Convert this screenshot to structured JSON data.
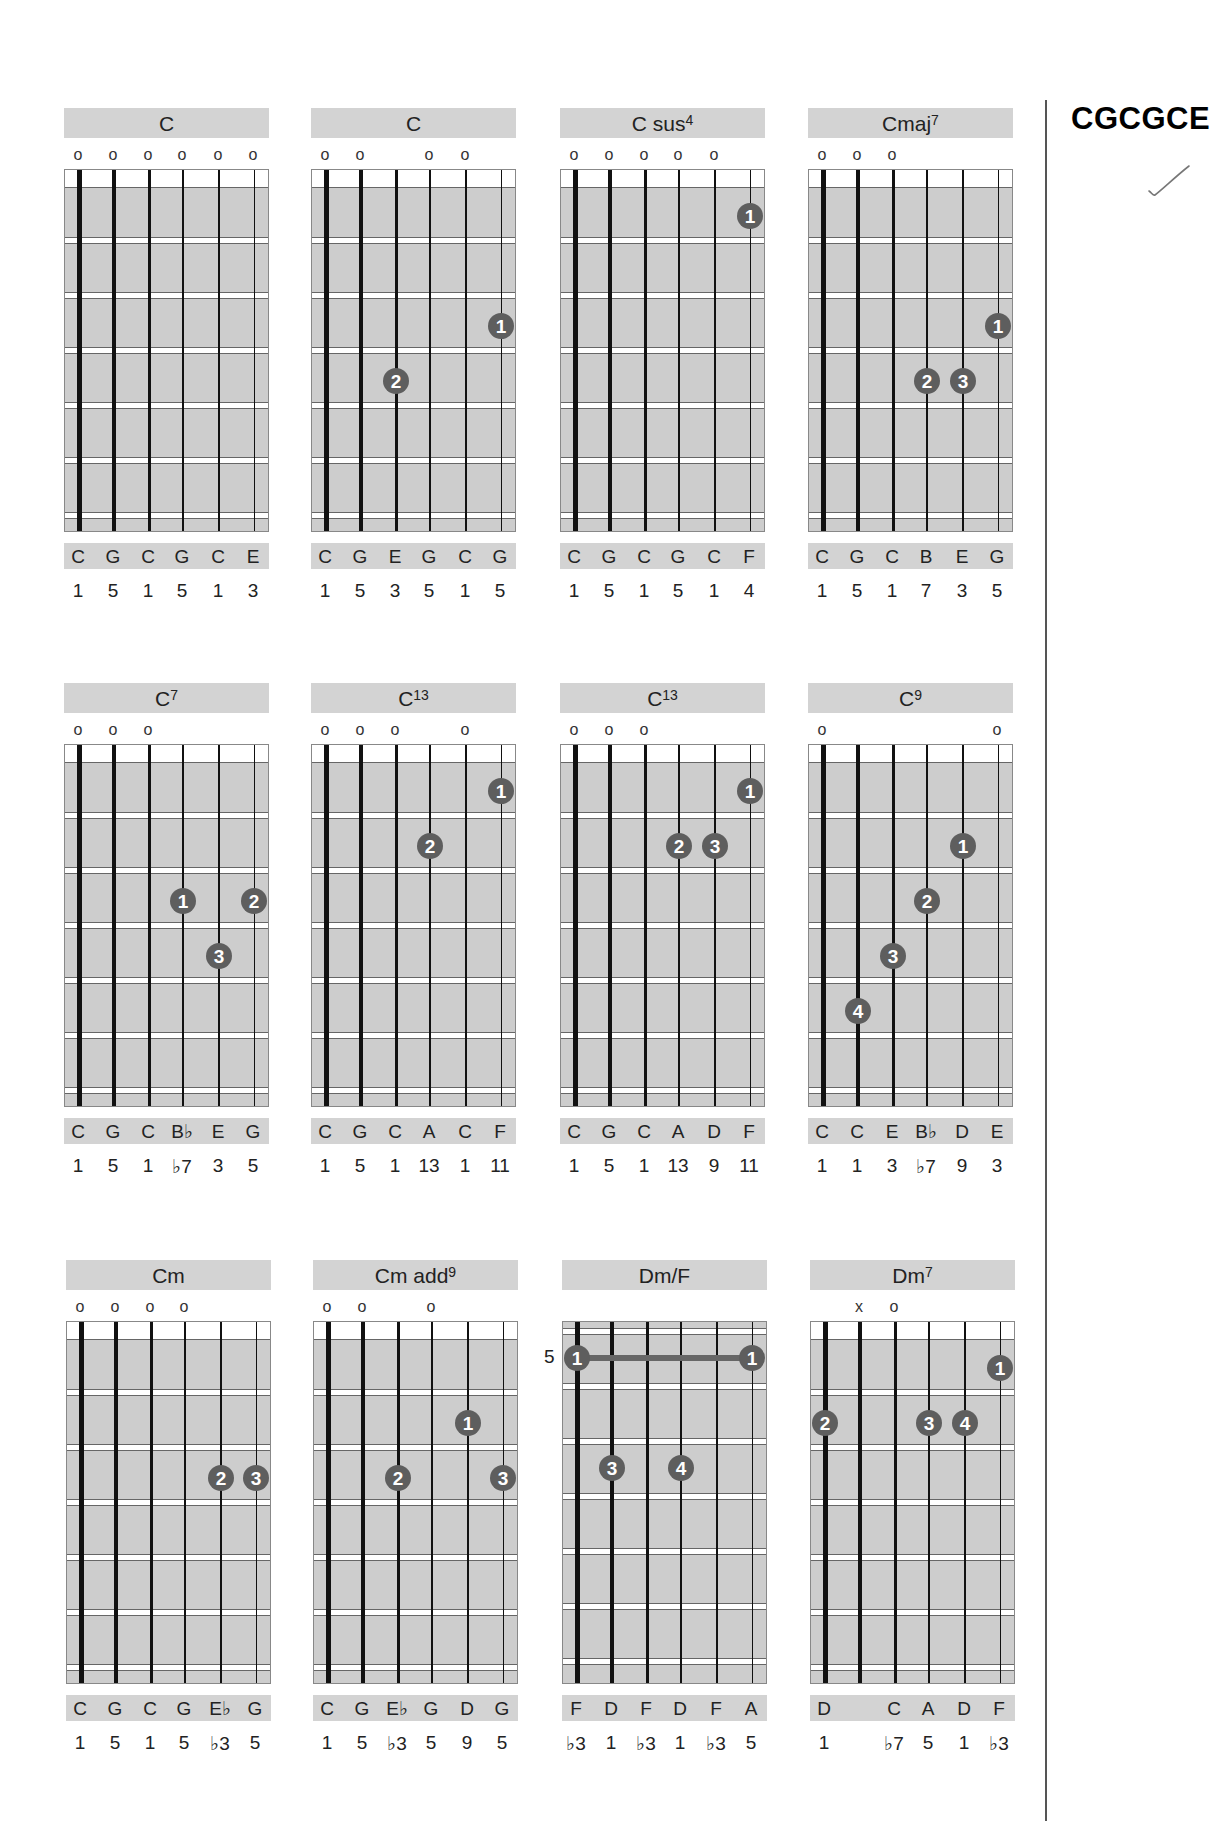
{
  "page": {
    "tuning_title": "CGCGCE",
    "check_mark": "checkmark"
  },
  "colors": {
    "header_bg": "#d3d3d3",
    "fretboard_bg": "#cdcdcd",
    "finger_dot": "#5e5e5e",
    "finger_text": "#ffffff",
    "string": "#111111"
  },
  "layout": {
    "columns_x": [
      64,
      311,
      560,
      808
    ],
    "rows": [
      {
        "top": 108,
        "x_offset": 0
      },
      {
        "top": 683,
        "x_offset": 0
      },
      {
        "top": 1260,
        "x_offset": 2
      }
    ]
  },
  "chords": [
    {
      "row": 0,
      "col": 0,
      "name": "C",
      "sup": "",
      "open": [
        "o",
        "o",
        "o",
        "o",
        "o",
        "o"
      ],
      "nut": true,
      "dots": [],
      "notes": [
        "C",
        "G",
        "C",
        "G",
        "C",
        "E"
      ],
      "intervals": [
        "1",
        "5",
        "1",
        "5",
        "1",
        "3"
      ]
    },
    {
      "row": 0,
      "col": 1,
      "name": "C",
      "sup": "",
      "open": [
        "o",
        "o",
        "",
        "o",
        "o",
        ""
      ],
      "nut": true,
      "dots": [
        {
          "string": 6,
          "fret": 3,
          "finger": "1"
        },
        {
          "string": 3,
          "fret": 4,
          "finger": "2"
        }
      ],
      "notes": [
        "C",
        "G",
        "E",
        "G",
        "C",
        "G"
      ],
      "intervals": [
        "1",
        "5",
        "3",
        "5",
        "1",
        "5"
      ]
    },
    {
      "row": 0,
      "col": 2,
      "name": "C sus",
      "sup": "4",
      "open": [
        "o",
        "o",
        "o",
        "o",
        "o",
        ""
      ],
      "nut": true,
      "dots": [
        {
          "string": 6,
          "fret": 1,
          "finger": "1"
        }
      ],
      "notes": [
        "C",
        "G",
        "C",
        "G",
        "C",
        "F"
      ],
      "intervals": [
        "1",
        "5",
        "1",
        "5",
        "1",
        "4"
      ]
    },
    {
      "row": 0,
      "col": 3,
      "name": "Cmaj",
      "sup": "7",
      "open": [
        "o",
        "o",
        "o",
        "",
        "",
        ""
      ],
      "nut": true,
      "dots": [
        {
          "string": 6,
          "fret": 3,
          "finger": "1"
        },
        {
          "string": 4,
          "fret": 4,
          "finger": "2"
        },
        {
          "string": 5,
          "fret": 4,
          "finger": "3"
        }
      ],
      "notes": [
        "C",
        "G",
        "C",
        "B",
        "E",
        "G"
      ],
      "intervals": [
        "1",
        "5",
        "1",
        "7",
        "3",
        "5"
      ]
    },
    {
      "row": 1,
      "col": 0,
      "name": "C",
      "sup": "7",
      "open": [
        "o",
        "o",
        "o",
        "",
        "",
        ""
      ],
      "nut": true,
      "dots": [
        {
          "string": 4,
          "fret": 3,
          "finger": "1"
        },
        {
          "string": 6,
          "fret": 3,
          "finger": "2"
        },
        {
          "string": 5,
          "fret": 4,
          "finger": "3"
        }
      ],
      "notes": [
        "C",
        "G",
        "C",
        "B♭",
        "E",
        "G"
      ],
      "intervals": [
        "1",
        "5",
        "1",
        "♭7",
        "3",
        "5"
      ]
    },
    {
      "row": 1,
      "col": 1,
      "name": "C",
      "sup": "13",
      "open": [
        "o",
        "o",
        "o",
        "",
        "o",
        ""
      ],
      "nut": true,
      "dots": [
        {
          "string": 6,
          "fret": 1,
          "finger": "1"
        },
        {
          "string": 4,
          "fret": 2,
          "finger": "2"
        }
      ],
      "notes": [
        "C",
        "G",
        "C",
        "A",
        "C",
        "F"
      ],
      "intervals": [
        "1",
        "5",
        "1",
        "13",
        "1",
        "11"
      ]
    },
    {
      "row": 1,
      "col": 2,
      "name": "C",
      "sup": "13",
      "open": [
        "o",
        "o",
        "o",
        "",
        "",
        ""
      ],
      "nut": true,
      "dots": [
        {
          "string": 6,
          "fret": 1,
          "finger": "1"
        },
        {
          "string": 4,
          "fret": 2,
          "finger": "2"
        },
        {
          "string": 5,
          "fret": 2,
          "finger": "3"
        }
      ],
      "notes": [
        "C",
        "G",
        "C",
        "A",
        "D",
        "F"
      ],
      "intervals": [
        "1",
        "5",
        "1",
        "13",
        "9",
        "11"
      ]
    },
    {
      "row": 1,
      "col": 3,
      "name": "C",
      "sup": "9",
      "open": [
        "o",
        "",
        "",
        "",
        "",
        "o"
      ],
      "nut": true,
      "dots": [
        {
          "string": 5,
          "fret": 2,
          "finger": "1"
        },
        {
          "string": 4,
          "fret": 3,
          "finger": "2"
        },
        {
          "string": 3,
          "fret": 4,
          "finger": "3"
        },
        {
          "string": 2,
          "fret": 5,
          "finger": "4"
        }
      ],
      "notes": [
        "C",
        "C",
        "E",
        "B♭",
        "D",
        "E"
      ],
      "intervals": [
        "1",
        "1",
        "3",
        "♭7",
        "9",
        "3"
      ]
    },
    {
      "row": 2,
      "col": 0,
      "name": "Cm",
      "sup": "",
      "open": [
        "o",
        "o",
        "o",
        "o",
        "",
        ""
      ],
      "nut": true,
      "dots": [
        {
          "string": 5,
          "fret": 3,
          "finger": "2"
        },
        {
          "string": 6,
          "fret": 3,
          "finger": "3"
        }
      ],
      "notes": [
        "C",
        "G",
        "C",
        "G",
        "E♭",
        "G"
      ],
      "intervals": [
        "1",
        "5",
        "1",
        "5",
        "♭3",
        "5"
      ]
    },
    {
      "row": 2,
      "col": 1,
      "name": "Cm add",
      "sup": "9",
      "open": [
        "o",
        "o",
        "",
        "o",
        "",
        ""
      ],
      "nut": true,
      "dots": [
        {
          "string": 5,
          "fret": 2,
          "finger": "1"
        },
        {
          "string": 3,
          "fret": 3,
          "finger": "2"
        },
        {
          "string": 6,
          "fret": 3,
          "finger": "3"
        }
      ],
      "notes": [
        "C",
        "G",
        "E♭",
        "G",
        "D",
        "G"
      ],
      "intervals": [
        "1",
        "5",
        "♭3",
        "5",
        "9",
        "5"
      ]
    },
    {
      "row": 2,
      "col": 2,
      "name": "Dm/F",
      "sup": "",
      "open": [
        "",
        "",
        "",
        "",
        "",
        ""
      ],
      "nut": false,
      "position": "5",
      "barre": {
        "fret": 1,
        "from": 1,
        "to": 6,
        "finger": "1"
      },
      "dots": [
        {
          "string": 2,
          "fret": 3,
          "finger": "3"
        },
        {
          "string": 4,
          "fret": 3,
          "finger": "4"
        }
      ],
      "notes": [
        "F",
        "D",
        "F",
        "D",
        "F",
        "A"
      ],
      "intervals": [
        "♭3",
        "1",
        "♭3",
        "1",
        "♭3",
        "5"
      ]
    },
    {
      "row": 2,
      "col": 3,
      "name": "Dm",
      "sup": "7",
      "open": [
        "",
        "x",
        "o",
        "",
        "",
        ""
      ],
      "nut": true,
      "dots": [
        {
          "string": 6,
          "fret": 1,
          "finger": "1"
        },
        {
          "string": 1,
          "fret": 2,
          "finger": "2"
        },
        {
          "string": 4,
          "fret": 2,
          "finger": "3"
        },
        {
          "string": 5,
          "fret": 2,
          "finger": "4"
        }
      ],
      "notes": [
        "D",
        "",
        "C",
        "A",
        "D",
        "F"
      ],
      "intervals": [
        "1",
        "",
        "♭7",
        "5",
        "1",
        "♭3"
      ]
    }
  ]
}
